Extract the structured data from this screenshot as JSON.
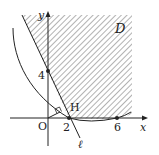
{
  "figure": {
    "region_label": "D",
    "axis_x_label": "x",
    "axis_y_label": "y",
    "origin_label": "O",
    "line_label": "ℓ",
    "foot_label": "H",
    "tick_labels": {
      "x1": "2",
      "x2": "6",
      "y1": "4"
    },
    "colors": {
      "stroke": "#222222",
      "hatch": "#555555",
      "background": "#ffffff"
    }
  }
}
